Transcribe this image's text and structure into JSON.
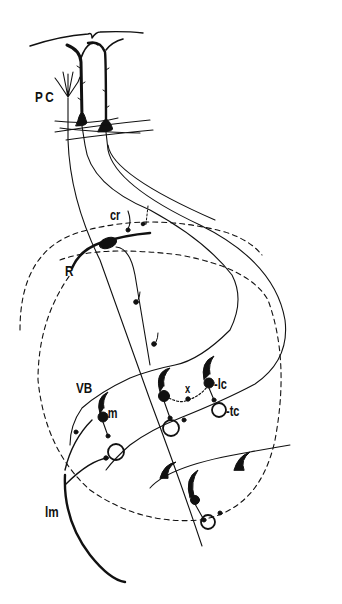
{
  "diagram": {
    "type": "neuroanatomical schematic",
    "colors": {
      "ink": "#111111",
      "background": "#ffffff"
    },
    "labels": {
      "pc": "PC",
      "cr": "cr",
      "r": "R",
      "vb": "VB",
      "m": "-m",
      "x": "x",
      "lc": "-lc",
      "tc": "-tc",
      "lm": "lm"
    },
    "regions": [
      {
        "id": "cortex",
        "label": "PC"
      },
      {
        "id": "reticular-nucleus",
        "label": "R"
      },
      {
        "id": "ventrobasal-complex",
        "label": "VB"
      },
      {
        "id": "medial-lemniscus",
        "label": "lm"
      }
    ],
    "elements": [
      {
        "id": "corticothalamic-collateral",
        "label": "cr"
      },
      {
        "id": "medium-cell",
        "label": "-m"
      },
      {
        "id": "interneuron-link",
        "label": "x"
      },
      {
        "id": "large-cell",
        "label": "-lc"
      },
      {
        "id": "thalamocortical-cell",
        "label": "-tc"
      }
    ]
  }
}
